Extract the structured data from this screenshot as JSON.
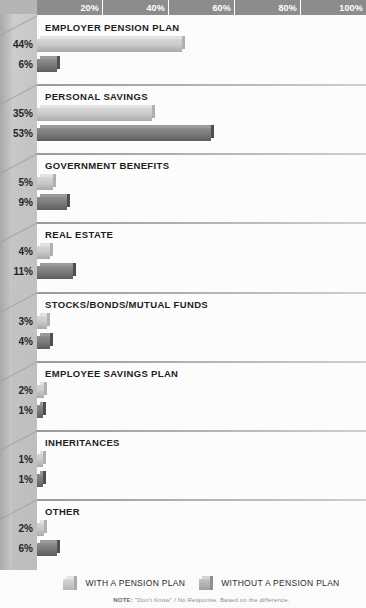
{
  "chart_data": {
    "type": "bar",
    "orientation": "horizontal",
    "title": "",
    "xlabel": "",
    "ylabel": "",
    "xlim": [
      0,
      100
    ],
    "xticks": [
      "20%",
      "40%",
      "60%",
      "80%",
      "100%"
    ],
    "xtick_values": [
      20,
      40,
      60,
      80,
      100
    ],
    "grid": false,
    "legend_position": "bottom",
    "categories": [
      "EMPLOYER PENSION PLAN",
      "PERSONAL SAVINGS",
      "GOVERNMENT BENEFITS",
      "REAL ESTATE",
      "STOCKS/BONDS/MUTUAL FUNDS",
      "EMPLOYEE SAVINGS PLAN",
      "INHERITANCES",
      "OTHER"
    ],
    "series": [
      {
        "name": "WITH A PENSION PLAN",
        "color": "#c9c9c9",
        "values": [
          44,
          35,
          5,
          4,
          3,
          2,
          1,
          2
        ],
        "labels": [
          "44%",
          "35%",
          "5%",
          "4%",
          "3%",
          "2%",
          "1%",
          "2%"
        ]
      },
      {
        "name": "WITHOUT A PENSION PLAN",
        "color": "#7a7a7a",
        "values": [
          6,
          53,
          9,
          11,
          4,
          1,
          1,
          6
        ],
        "labels": [
          "6%",
          "53%",
          "9%",
          "11%",
          "4%",
          "1%",
          "1%",
          "6%"
        ]
      }
    ]
  },
  "axis": {
    "ticks": [
      "20%",
      "40%",
      "60%",
      "80%",
      "100%"
    ]
  },
  "legend": {
    "items": [
      {
        "label": "WITH A PENSION PLAN",
        "swatch": "light"
      },
      {
        "label": "WITHOUT A PENSION PLAN",
        "swatch": "dark"
      }
    ]
  },
  "footnote": {
    "prefix": "NOTE:",
    "text": "\"Don't Know\" / No Response. Based on the difference."
  },
  "colors": {
    "header_band": "#8c8c8c",
    "light_bar": "#c9c9c9",
    "dark_bar": "#7a7a7a",
    "wall": "#c4c4c4"
  }
}
